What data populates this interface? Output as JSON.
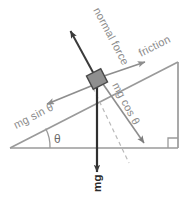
{
  "diagram": {
    "labels": {
      "normal_force": "normal force",
      "friction": "friction",
      "mg_sin_theta": "mg sin θ",
      "mg_cos_theta": "mg cos θ",
      "weight": "mg",
      "angle": "θ"
    },
    "colors": {
      "incline_line": "#9a9a9a",
      "arrow_gray": "#8e8e8e",
      "arrow_dark": "#3a3a3a",
      "block_fill": "#8f8f8f",
      "block_stroke": "#4a4a4a",
      "label_gray": "#8c8c8c",
      "label_dark": "#2b2b2b",
      "background": "#ffffff",
      "dashed": "#b4b4b4"
    },
    "geometry": {
      "incline_angle_deg": 28,
      "triangle_left_vertex": [
        10,
        148
      ],
      "triangle_apex": [
        178,
        62
      ],
      "triangle_right_vertex": [
        178,
        148
      ],
      "block_center": [
        97,
        79
      ],
      "block_size": 15,
      "normal_force_tip": [
        68,
        28
      ],
      "friction_tip": [
        148,
        61
      ],
      "mg_sin_tip": [
        44,
        105
      ],
      "mg_cos_tip": [
        147,
        147
      ],
      "weight_tip": [
        97,
        176
      ]
    },
    "label_rotations": {
      "normal_force": -62,
      "friction": -27,
      "mg_sin_theta": -27,
      "mg_cos_theta": 62,
      "weight": -90
    }
  }
}
